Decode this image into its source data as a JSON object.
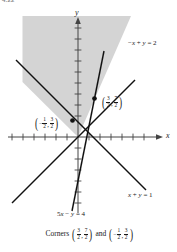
{
  "figure": {
    "number": "4.22",
    "caption": {
      "lead": "Corners",
      "conjunction": "and",
      "point_a": {
        "x_num": "3",
        "x_den": "2",
        "y_num": "7",
        "y_den": "2",
        "x_sign": "",
        "y_sign": ""
      },
      "point_b": {
        "x_num": "1",
        "x_den": "2",
        "y_num": "3",
        "y_den": "2",
        "x_sign": "−",
        "y_sign": ""
      }
    }
  },
  "axes": {
    "x_label": "x",
    "y_label": "y",
    "x_range": [
      -6,
      8
    ],
    "y_range": [
      -7,
      9
    ],
    "tick_spacing": 1,
    "grid": false
  },
  "chart_data": {
    "type": "line",
    "title": "",
    "xlabel": "x",
    "ylabel": "y",
    "xlim": [
      -6.4,
      8.4
    ],
    "ylim": [
      -7.2,
      9.2
    ],
    "grid": false,
    "legend": "none",
    "series": [
      {
        "name": "-x + y = 2",
        "label": "−x + y = 2",
        "slope": 1,
        "intercept": 2,
        "x_start": -6.0,
        "x_end": 5.2,
        "label_x": 6.0,
        "label_y": 5.6
      },
      {
        "name": "x + y = 1",
        "label": "x + y = 1",
        "slope": -1,
        "intercept": 1,
        "x_start": -5.6,
        "x_end": 6.2,
        "label_x": 6.2,
        "label_y": -5.3
      },
      {
        "name": "5x - y = 4",
        "label": "5x − y = 4",
        "slope": 5,
        "intercept": -4,
        "x_start": -0.55,
        "x_end": 2.35,
        "label_x": 0.2,
        "label_y": -7.1
      }
    ],
    "points": [
      {
        "name": "corner-upper-right",
        "x": 1.5,
        "y": 3.5,
        "x_num": "3",
        "x_den": "2",
        "y_num": "7",
        "y_den": "2",
        "x_sign": "",
        "y_sign": ""
      },
      {
        "name": "corner-left",
        "x": -0.5,
        "y": 1.5,
        "x_num": "1",
        "x_den": "2",
        "y_num": "3",
        "y_den": "2",
        "x_sign": "−",
        "y_sign": ""
      }
    ],
    "shaded_region": {
      "label": "feasible-region",
      "color": "#d5d5d5",
      "description": "Region above -x + y = 2 and above 5x - y = 4, unbounded upward"
    }
  },
  "colors": {
    "line": "#111111",
    "axis": "#444444",
    "shade": "#d4d4d4",
    "text": "#1a1a1a"
  }
}
